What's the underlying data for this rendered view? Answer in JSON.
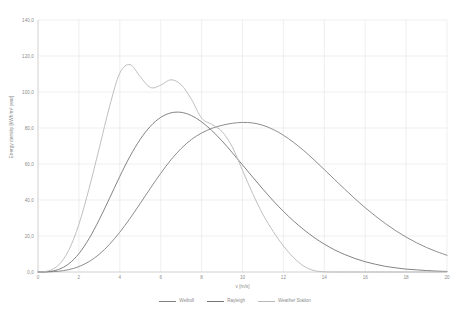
{
  "chart_data": {
    "type": "line",
    "title": "",
    "xlabel": "v [m/s]",
    "ylabel": "Energy density [kWh/m² year]",
    "xlim": [
      0,
      20
    ],
    "ylim": [
      0,
      140
    ],
    "grid": true,
    "legend_position": "bottom",
    "x_ticks": [
      "0",
      "2",
      "4",
      "6",
      "8",
      "10",
      "12",
      "14",
      "16",
      "18",
      "20"
    ],
    "x_tick_values": [
      0,
      2,
      4,
      6,
      8,
      10,
      12,
      14,
      16,
      18,
      20
    ],
    "y_ticks": [
      "0,0",
      "20,0",
      "40,0",
      "60,0",
      "80,0",
      "100,0",
      "120,0",
      "140,0"
    ],
    "y_tick_values": [
      0,
      20,
      40,
      60,
      80,
      100,
      120,
      140
    ],
    "x": [
      0,
      0.5,
      1,
      1.5,
      2,
      2.5,
      3,
      3.5,
      4,
      4.5,
      5,
      5.5,
      6,
      6.5,
      7,
      7.5,
      8,
      8.5,
      9,
      9.5,
      10,
      10.5,
      11,
      11.5,
      12,
      12.5,
      13,
      13.5,
      14,
      14.5,
      15,
      15.5,
      16,
      16.5,
      17,
      17.5,
      18,
      18.5,
      19,
      19.5,
      20
    ],
    "series": [
      {
        "name": "Weibull",
        "color": "#808080",
        "values": [
          0.0,
          0.1,
          0.4,
          1.3,
          3.0,
          5.8,
          9.9,
          15.4,
          22.1,
          29.8,
          38.1,
          46.6,
          54.8,
          62.3,
          68.6,
          73.6,
          77.2,
          79.8,
          81.5,
          82.6,
          83.1,
          82.8,
          81.5,
          79.2,
          76.0,
          72.0,
          67.4,
          62.3,
          56.9,
          51.4,
          46.0,
          40.7,
          35.7,
          31.1,
          26.8,
          22.9,
          19.4,
          16.3,
          13.6,
          11.3,
          9.3
        ]
      },
      {
        "name": "Rayleigh",
        "color": "#757575",
        "values": [
          0.0,
          0.2,
          1.4,
          4.5,
          10.2,
          18.6,
          29.2,
          41.0,
          53.1,
          64.3,
          73.7,
          81.0,
          85.9,
          88.4,
          88.7,
          86.9,
          83.4,
          78.6,
          72.8,
          66.3,
          59.5,
          52.7,
          46.0,
          39.6,
          33.7,
          28.3,
          23.5,
          19.2,
          15.5,
          12.3,
          9.7,
          7.5,
          5.7,
          4.3,
          3.1,
          2.3,
          1.6,
          1.2,
          0.8,
          0.5,
          0.3
        ]
      },
      {
        "name": "Weather Station",
        "color": "#b8b8b8",
        "values": [
          0.0,
          0.6,
          3.8,
          12.0,
          26.5,
          46.5,
          69.0,
          92.0,
          110.5,
          115.2,
          108.5,
          102.5,
          103.8,
          106.8,
          104.0,
          96.0,
          85.5,
          82.0,
          78.0,
          69.5,
          56.5,
          43.5,
          32.0,
          22.5,
          14.5,
          8.0,
          3.2,
          0.8,
          0.1,
          0.0,
          0.0,
          0.0,
          0.0,
          0.0,
          0.0,
          0.0,
          0.0,
          0.0,
          0.0,
          0.0,
          0.0
        ]
      }
    ]
  },
  "axes": {
    "x_title": "v [m/s]",
    "y_title": "Energy density [kWh/m² year]"
  },
  "legend": {
    "items": [
      {
        "label": "Weibull",
        "color": "#808080"
      },
      {
        "label": "Rayleigh",
        "color": "#757575"
      },
      {
        "label": "Weather Station",
        "color": "#b8b8b8"
      }
    ]
  },
  "style": {
    "grid_color": "#e8e8e8",
    "axis_color": "#d0d0d0",
    "text_color": "#8c8c8c",
    "background": "#ffffff"
  }
}
